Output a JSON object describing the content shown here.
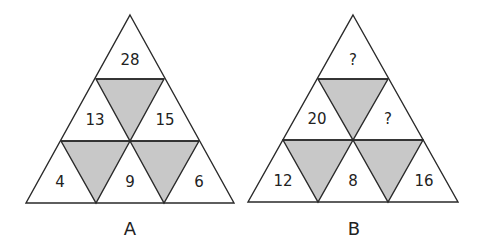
{
  "puzzle": {
    "colors": {
      "shaded": "#c8c8c8",
      "line": "#2a2a2a",
      "background": "#ffffff"
    },
    "triangles": [
      {
        "label": "A",
        "values": {
          "top": "28",
          "middle_left": "13",
          "middle_right": "15",
          "bottom_left": "4",
          "bottom_center": "9",
          "bottom_right": "6"
        }
      },
      {
        "label": "B",
        "values": {
          "top": "?",
          "middle_left": "20",
          "middle_right": "?",
          "bottom_left": "12",
          "bottom_center": "8",
          "bottom_right": "16"
        }
      }
    ]
  }
}
